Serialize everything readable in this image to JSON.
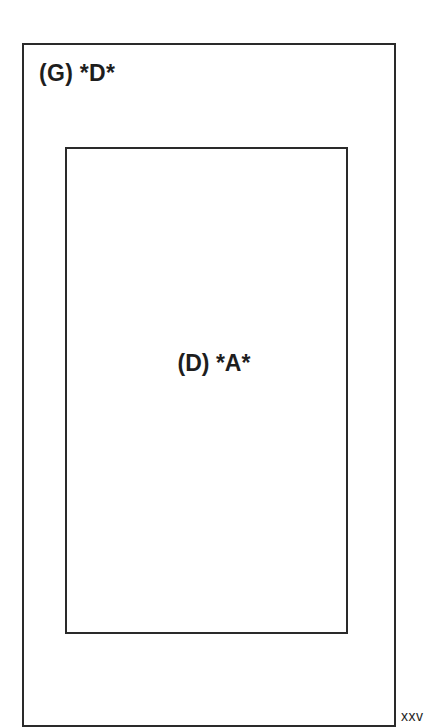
{
  "diagram": {
    "outer_box": {
      "label": "(G) *D*"
    },
    "inner_box": {
      "label": "(D) *A*"
    },
    "page_number": "xxv"
  }
}
